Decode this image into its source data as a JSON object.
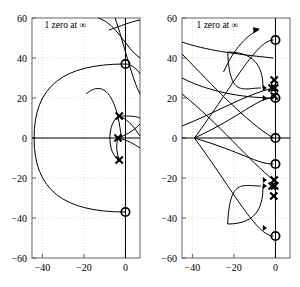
{
  "figure": {
    "type": "root-locus-pair",
    "background": "#ffffff",
    "ink": "#000000",
    "grid_color": "#bfbfbf"
  },
  "chart_data": [
    {
      "id": "left-plot",
      "type": "scatter",
      "title": "",
      "xlabel": "",
      "ylabel": "",
      "xlim": [
        -45,
        7
      ],
      "ylim": [
        -60,
        60
      ],
      "xticks": [
        -40,
        -20,
        0
      ],
      "xticklabels": [
        "-40",
        "-20",
        "0"
      ],
      "yticks": [
        -60,
        -40,
        -20,
        0,
        20,
        40,
        60
      ],
      "yticklabels": [
        "-60",
        "-40",
        "-20",
        "0",
        "20",
        "40",
        "60"
      ],
      "grid": true,
      "legend": "none",
      "annotations": [
        {
          "text": "1 zero at ∞",
          "x": -39,
          "y": 55
        }
      ],
      "markers": {
        "zeros": [
          {
            "x": 0,
            "y": 37
          },
          {
            "x": 0,
            "y": -37
          }
        ],
        "poles": [
          {
            "x": -3.0,
            "y": 11
          },
          {
            "x": -3.6,
            "y": 0
          },
          {
            "x": -3.0,
            "y": -11
          }
        ]
      },
      "axes_lines": {
        "real": 0,
        "imag": 0
      }
    },
    {
      "id": "right-plot",
      "type": "scatter",
      "title": "",
      "xlabel": "",
      "ylabel": "",
      "xlim": [
        -45,
        7
      ],
      "ylim": [
        -60,
        60
      ],
      "xticks": [
        -40,
        -20,
        0
      ],
      "xticklabels": [
        "-40",
        "-20",
        "0"
      ],
      "yticks": [
        -60,
        -40,
        -20,
        0,
        20,
        40,
        60
      ],
      "yticklabels": [
        "-60",
        "-40",
        "-20",
        "0",
        "20",
        "40",
        "60"
      ],
      "grid": true,
      "legend": "none",
      "annotations": [
        {
          "text": "1 zero at ∞",
          "x": -38,
          "y": 55
        }
      ],
      "markers": {
        "zeros": [
          {
            "x": 0,
            "y": 49
          },
          {
            "x": 0,
            "y": 20
          },
          {
            "x": 0,
            "y": 0
          },
          {
            "x": 0,
            "y": -13
          },
          {
            "x": 0,
            "y": -49
          }
        ],
        "poles": [
          {
            "x": -0.6,
            "y": 29
          },
          {
            "x": -1.6,
            "y": 25
          },
          {
            "x": -0.4,
            "y": 25
          },
          {
            "x": -0.6,
            "y": 21
          },
          {
            "x": -0.6,
            "y": -21
          },
          {
            "x": -1.6,
            "y": -24
          },
          {
            "x": -0.4,
            "y": -24
          },
          {
            "x": -0.8,
            "y": -29
          }
        ]
      },
      "axes_lines": {
        "real": 0,
        "imag": 0
      }
    }
  ]
}
